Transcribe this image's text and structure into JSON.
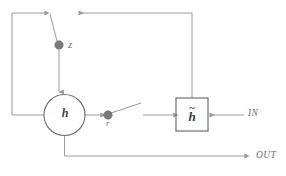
{
  "diagram": {
    "colors": {
      "wire": "#9a9a9a",
      "node_fill": "#7a7a7a",
      "node_stroke": "#6a6a6a",
      "shape_stroke": "#6e6e6e",
      "label": "#6e6e6e",
      "symbol": "#3d3d3d",
      "background": "#ffffff"
    },
    "nodes": {
      "z_gate": {
        "label": "z",
        "shape": "filled-circle",
        "x": 59,
        "y": 45,
        "r": 4.2
      },
      "r_gate": {
        "label": "r",
        "shape": "filled-circle",
        "x": 108,
        "y": 115,
        "r": 4.2
      },
      "state": {
        "label": "h",
        "shape": "circle",
        "cx": 64.5,
        "cy": 115,
        "r": 20.5
      },
      "candidate": {
        "label": "h",
        "accent": "~",
        "shape": "square",
        "x": 176,
        "y": 98,
        "w": 32,
        "h": 33
      }
    },
    "ports": {
      "input": "IN",
      "output": "OUT"
    },
    "wires": [
      {
        "name": "state-to-left-feedback",
        "path": "from h left edge, left, up, right to z switch"
      },
      {
        "name": "z-switch-arm",
        "path": "diagonal from top rail down to z node"
      },
      {
        "name": "z-to-state",
        "path": "vertical down into h"
      },
      {
        "name": "state-to-r",
        "path": "h right edge to r node"
      },
      {
        "name": "r-switch-arm",
        "path": "diagonal up-right from r node"
      },
      {
        "name": "r-to-candidate",
        "path": "right into h-tilde box"
      },
      {
        "name": "in-to-candidate",
        "path": "IN left into h-tilde box"
      },
      {
        "name": "candidate-to-top-rail",
        "path": "up from box then left along top"
      },
      {
        "name": "state-to-out",
        "path": "down from h then right to OUT"
      }
    ]
  }
}
